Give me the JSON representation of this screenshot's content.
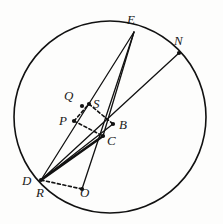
{
  "figure": {
    "canvas": {
      "width": 223,
      "height": 224,
      "background": "#fdfdfc"
    },
    "stroke_color": "#111111",
    "circle": {
      "cx": 110,
      "cy": 117,
      "r": 96,
      "stroke_width": 1.6
    },
    "points": [
      {
        "id": "E",
        "label": "E",
        "x": 134,
        "y": 32,
        "label_x": 127,
        "label_y": 13,
        "dot": false
      },
      {
        "id": "N",
        "label": "N",
        "x": 179,
        "y": 53,
        "label_x": 174,
        "label_y": 34,
        "dot": true
      },
      {
        "id": "Q",
        "label": "Q",
        "x": 82,
        "y": 106,
        "label_x": 64,
        "label_y": 89,
        "dot": true
      },
      {
        "id": "S",
        "label": "S",
        "x": 89,
        "y": 104,
        "label_x": 93,
        "label_y": 97,
        "dot": true
      },
      {
        "id": "P",
        "label": "P",
        "x": 74,
        "y": 121,
        "label_x": 59,
        "label_y": 114,
        "dot": true
      },
      {
        "id": "B",
        "label": "B",
        "x": 113,
        "y": 124,
        "label_x": 119,
        "label_y": 118,
        "dot": true
      },
      {
        "id": "C",
        "label": "C",
        "x": 103,
        "y": 136,
        "label_x": 107,
        "label_y": 134,
        "dot": true
      },
      {
        "id": "D",
        "label": "D",
        "x": 41,
        "y": 180,
        "label_x": 22,
        "label_y": 174,
        "dot": true
      },
      {
        "id": "R",
        "label": "R",
        "x": 48,
        "y": 187,
        "label_x": 36,
        "label_y": 186,
        "dot": false
      },
      {
        "id": "O",
        "label": "O",
        "x": 82,
        "y": 189,
        "label_x": 80,
        "label_y": 186,
        "dot": true
      }
    ],
    "solid_segments": [
      {
        "id": "E-D",
        "from": "E",
        "to": "D",
        "width": 1.3
      },
      {
        "id": "E-C",
        "from": "E",
        "to": "C",
        "width": 1.3
      },
      {
        "id": "E-O",
        "from": "E",
        "to": "O",
        "width": 1.3
      },
      {
        "id": "D-N",
        "from": "D",
        "to": "N",
        "width": 1.3
      },
      {
        "id": "D-B",
        "from": "D",
        "to": "B",
        "width": 1.3
      },
      {
        "id": "D-C",
        "from": "D",
        "to": "C",
        "width": 2.6
      }
    ],
    "dashed_segments": [
      {
        "id": "P-S",
        "from": "P",
        "to": "S"
      },
      {
        "id": "S-B",
        "from": "S",
        "to": "B"
      },
      {
        "id": "P-C",
        "from": "P",
        "to": "C"
      },
      {
        "id": "D-O",
        "from": "D",
        "to": "O"
      }
    ],
    "dash_pattern": "3,2.6"
  }
}
